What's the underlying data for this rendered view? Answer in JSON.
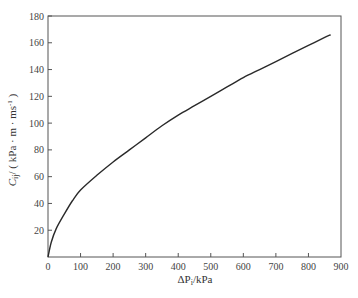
{
  "chart_data": {
    "type": "line",
    "title": "",
    "xlabel": "ΔP_i/kPa",
    "ylabel": "C_ij / ( kPa · m · ms⁻¹ )",
    "xlim": [
      0,
      900
    ],
    "ylim": [
      0,
      180
    ],
    "xticks": [
      0,
      100,
      200,
      300,
      400,
      500,
      600,
      700,
      800,
      900
    ],
    "yticks": [
      20,
      40,
      60,
      80,
      100,
      120,
      140,
      160,
      180
    ],
    "y_zero_label": "0",
    "grid": false,
    "legend": null,
    "series": [
      {
        "name": "C_ij vs ΔP_i",
        "color": "#2a2a2a",
        "x": [
          0,
          10,
          25,
          50,
          75,
          100,
          150,
          200,
          250,
          300,
          350,
          400,
          450,
          500,
          550,
          600,
          650,
          700,
          750,
          800,
          850,
          868
        ],
        "y": [
          0,
          11,
          21,
          32,
          42,
          50,
          61,
          71,
          80,
          89,
          98,
          106,
          113,
          120,
          127,
          134,
          140,
          146,
          152,
          158,
          164,
          166
        ]
      }
    ]
  },
  "axes": {
    "x_title_main": "ΔP",
    "x_title_sub": "i",
    "x_title_unit": "/kPa",
    "y_title_main": "C",
    "y_title_sub": "ij",
    "y_title_unit": "/ ( kPa · m · ms",
    "y_title_sup": "-1",
    "y_title_close": " )"
  }
}
